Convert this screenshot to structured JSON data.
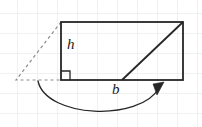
{
  "figure": {
    "background_color": "#ffffff",
    "grid": {
      "visible": true,
      "color": "#dfe3ea",
      "spacing_px": 20,
      "origin_x": 17,
      "origin_y": 13,
      "line_width": 1
    },
    "stroke_color": "#262626",
    "dashed_color": "#8c8c8c",
    "arrow_color": "#262626",
    "labels": {
      "height": "h",
      "base": "b"
    },
    "shapes": {
      "rectangle": {
        "name": "rectangle",
        "x": 61,
        "y": 22,
        "width": 122,
        "height": 58,
        "stroke_width": 1.8
      },
      "diagonal": {
        "name": "slant-cut-line",
        "x1": 122,
        "y1": 80,
        "x2": 183,
        "y2": 22,
        "stroke_width": 1.8
      },
      "dashed_triangle": {
        "name": "dashed-triangle",
        "points": "16,80 61,22 61,80",
        "dash_pattern": "3,3",
        "stroke_width": 1.2
      },
      "right_angle_marker": {
        "name": "right-angle-marker",
        "x": 61,
        "y": 80,
        "size": 9,
        "stroke_width": 1.3
      },
      "curved_arrow": {
        "name": "move-piece-arrow",
        "path": "M 38 81 C 46 118, 140 122, 159 88",
        "stroke_width": 1.3,
        "arrow_head": "154,85 163,83 157,94"
      }
    },
    "label_positions": {
      "height": {
        "x": 67,
        "y": 49
      },
      "base": {
        "x": 112,
        "y": 94
      }
    }
  }
}
